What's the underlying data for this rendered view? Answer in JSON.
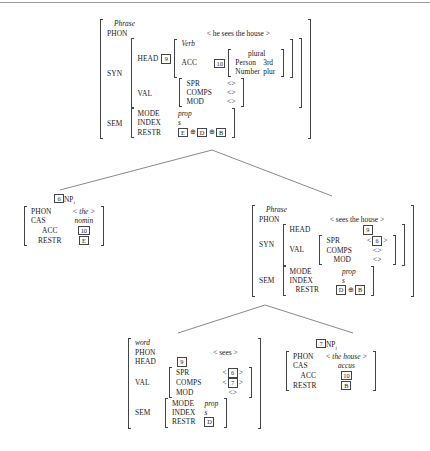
{
  "diagram": {
    "kind": "hpsg-feature-structure-tree",
    "title_rule": "",
    "operators": {
      "append": "⊕",
      "list_open": "<",
      "list_close": ">",
      "empty_list": "<>"
    },
    "nodes": {
      "root": {
        "id": "root-phrase",
        "type": "Phrase",
        "phon_attr": "PHON",
        "phon_value": "< he sees the house >",
        "syn_attr": "SYN",
        "head_attr": "HEAD",
        "head_tag": "9",
        "head_type": "Verb",
        "acc_attr": "ACC",
        "acc_tag": "10",
        "agr_type": "plural",
        "person_attr": "Person",
        "person_value": "3rd",
        "number_attr": "Number",
        "number_value": "plur",
        "val_attr": "VAL",
        "spr_attr": "SPR",
        "spr_value": "<>",
        "comps_attr": "COMPS",
        "comps_value": "<>",
        "mod_attr": "MOD",
        "mod_value": "<>",
        "sem_attr": "SEM",
        "mode_attr": "MODE",
        "mode_value": "prop",
        "index_attr": "INDEX",
        "index_value": "s",
        "restr_attr": "RESTR",
        "restr_tags": [
          "E",
          "D",
          "B"
        ]
      },
      "left_np": {
        "id": "left-np",
        "tag": "6",
        "label": "NP",
        "label_sub": "i",
        "phon_attr": "PHON",
        "phon_value": "< the >",
        "cas_attr": "CAS",
        "cas_value": "nomin",
        "acc_attr": "ACC",
        "acc_tag": "10",
        "restr_attr": "RESTR",
        "restr_tag": "E"
      },
      "vp_phrase": {
        "id": "vp-phrase",
        "type": "Phrase",
        "phon_attr": "PHON",
        "phon_value": "< sees the house >",
        "syn_attr": "SYN",
        "head_attr": "HEAD",
        "head_tag": "9",
        "val_attr": "VAL",
        "spr_attr": "SPR",
        "spr_tag": "6",
        "comps_attr": "COMPS",
        "comps_value": "<>",
        "mod_attr": "MOD",
        "mod_value": "<>",
        "sem_attr": "SEM",
        "mode_attr": "MODE",
        "mode_value": "prop",
        "index_attr": "INDEX",
        "index_value": "s",
        "restr_attr": "RESTR",
        "restr_tags": [
          "D",
          "B"
        ]
      },
      "verb_word": {
        "id": "verb-word",
        "type": "word",
        "phon_attr": "PHON",
        "phon_value": "< sees >",
        "head_attr": "HEAD",
        "head_tag": "9",
        "val_attr": "VAL",
        "spr_attr": "SPR",
        "spr_tag": "6",
        "comps_attr": "COMPS",
        "comps_tag": "7",
        "mod_attr": "MOD",
        "mod_value": "<>",
        "sem_attr": "SEM",
        "mode_attr": "MODE",
        "mode_value": "prop",
        "index_attr": "INDEX",
        "index_value": "s",
        "restr_attr": "RESTR",
        "restr_tag": "D"
      },
      "right_np": {
        "id": "right-np",
        "tag": "7",
        "label": "NP",
        "label_sub": "j",
        "phon_attr": "PHON",
        "phon_value": "< the house >",
        "cas_attr": "CAS",
        "cas_value": "accus",
        "acc_attr": "ACC",
        "acc_tag": "10",
        "restr_attr": "RESTR",
        "restr_tag": "B"
      }
    }
  }
}
